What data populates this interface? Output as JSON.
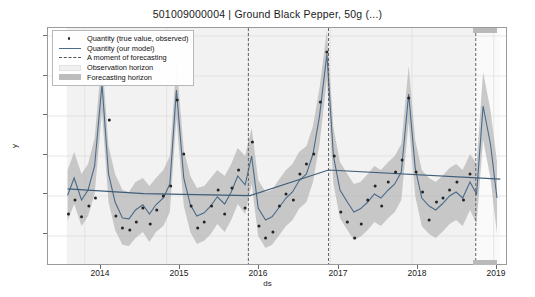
{
  "header": {
    "sku": "501009000004",
    "separator": "|",
    "product": "Ground Black Pepper, 50g (...)",
    "title": "501009000004   |   Ground Black Pepper, 50g (...)"
  },
  "legend": {
    "position": "upper-left",
    "items": [
      {
        "label": "Quantity (true value, observed)",
        "marker": "dot",
        "color": "#2b2b2b"
      },
      {
        "label": "Quantity (our model)",
        "marker": "line",
        "color": "#4a6b8a"
      },
      {
        "label": "A moment of forecasting",
        "marker": "dashed",
        "color": "#555555"
      },
      {
        "label": "Observation horizon",
        "marker": "patch",
        "color": "#f0f0f0"
      },
      {
        "label": "Forecasting horizon",
        "marker": "patch",
        "color": "#bcbcbc"
      }
    ]
  },
  "axes": {
    "ylabel": "y",
    "xlabel": "ds",
    "yticks": [
      "10000",
      "20000",
      "30000",
      "40000",
      "50000",
      "60000"
    ],
    "xticks": [
      "2014",
      "2015",
      "2016",
      "2017",
      "2018",
      "2019"
    ]
  },
  "chart_data": {
    "type": "line",
    "title": "501009000004   |   Ground Black Pepper, 50g (...)",
    "xlabel": "ds",
    "ylabel": "y",
    "ylim": [
      3000,
      62000
    ],
    "xlim": [
      2013.55,
      2019.15
    ],
    "grid": true,
    "legend_position": "upper-left",
    "ytick_values": [
      10000,
      20000,
      30000,
      40000,
      50000,
      60000
    ],
    "xtick_values": [
      2014,
      2015,
      2016,
      2017,
      2018,
      2019
    ],
    "forecast_cutoff_x": 2018.78,
    "changepoint_lines_x": [
      2016.0,
      2016.98
    ],
    "observation_horizon": [
      2013.78,
      2018.78
    ],
    "forecasting_horizon": [
      2018.78,
      2019.08
    ],
    "series": [
      {
        "name": "Quantity (our model)",
        "type": "line",
        "color": "#4a6b8a",
        "x": [
          2013.79,
          2013.87,
          2013.96,
          2014.04,
          2014.12,
          2014.21,
          2014.29,
          2014.37,
          2014.46,
          2014.54,
          2014.62,
          2014.71,
          2014.79,
          2014.87,
          2014.96,
          2015.04,
          2015.12,
          2015.21,
          2015.29,
          2015.37,
          2015.46,
          2015.54,
          2015.62,
          2015.71,
          2015.79,
          2015.87,
          2015.96,
          2016.04,
          2016.12,
          2016.21,
          2016.29,
          2016.37,
          2016.46,
          2016.54,
          2016.62,
          2016.71,
          2016.79,
          2016.87,
          2016.96,
          2017.04,
          2017.12,
          2017.21,
          2017.29,
          2017.37,
          2017.46,
          2017.54,
          2017.62,
          2017.71,
          2017.79,
          2017.87,
          2017.96,
          2018.04,
          2018.12,
          2018.21,
          2018.29,
          2018.37,
          2018.46,
          2018.54,
          2018.62,
          2018.71,
          2018.79,
          2018.87,
          2018.96,
          2019.04
        ],
        "y": [
          20200,
          24500,
          19000,
          21500,
          27500,
          48000,
          25500,
          18500,
          14500,
          14300,
          16500,
          17800,
          15500,
          17800,
          19500,
          23000,
          46500,
          24500,
          17800,
          15000,
          15800,
          17500,
          19800,
          18000,
          21000,
          25000,
          22800,
          30000,
          17000,
          14000,
          14800,
          17000,
          19500,
          21000,
          23800,
          25500,
          30500,
          40000,
          55500,
          30000,
          21500,
          18500,
          16000,
          16800,
          18500,
          20500,
          19500,
          21500,
          23000,
          26000,
          45500,
          27000,
          19500,
          17500,
          16500,
          18000,
          20000,
          21000,
          19500,
          23500,
          20500,
          42500,
          33000,
          19500
        ]
      },
      {
        "name": "Uncertainty band upper",
        "type": "band_upper",
        "color": "#b4b4b4",
        "y": [
          26500,
          31000,
          25500,
          28000,
          34500,
          55000,
          32500,
          25500,
          21500,
          21000,
          23500,
          24500,
          22500,
          24500,
          26500,
          30000,
          53500,
          31500,
          25000,
          22000,
          22500,
          24500,
          26500,
          25000,
          28000,
          32000,
          30000,
          37000,
          24000,
          21000,
          21500,
          24000,
          26500,
          28000,
          31000,
          32500,
          37500,
          47000,
          61500,
          37000,
          28500,
          25500,
          23000,
          23500,
          25500,
          27500,
          26500,
          28500,
          30000,
          33000,
          52500,
          34000,
          26500,
          24500,
          23500,
          25000,
          27000,
          28000,
          26500,
          30500,
          28000,
          51000,
          41500,
          28500
        ]
      },
      {
        "name": "Uncertainty band lower",
        "type": "band_lower",
        "color": "#b4b4b4",
        "y": [
          13800,
          18000,
          12500,
          15000,
          20500,
          41000,
          18500,
          11500,
          7800,
          7500,
          9500,
          11000,
          8500,
          11000,
          12500,
          16000,
          39500,
          17500,
          11000,
          8000,
          8800,
          10500,
          13000,
          11000,
          14000,
          18000,
          15500,
          23000,
          10000,
          7000,
          7800,
          10000,
          12500,
          14000,
          16800,
          18500,
          23500,
          33000,
          49000,
          23000,
          14500,
          11500,
          9000,
          9800,
          11500,
          13500,
          12500,
          14500,
          16000,
          19000,
          38500,
          20000,
          12500,
          10500,
          9500,
          11000,
          13000,
          14000,
          12500,
          16500,
          13000,
          34000,
          24500,
          10500
        ]
      },
      {
        "name": "Trend",
        "type": "trend",
        "color": "#3f5d78",
        "x": [
          2013.79,
          2014.72,
          2016.02,
          2016.98,
          2019.08
        ],
        "y": [
          21800,
          20600,
          20100,
          26500,
          24200
        ]
      },
      {
        "name": "Quantity (true value, observed)",
        "type": "scatter",
        "color": "#2b2b2b",
        "x": [
          2013.8,
          2013.88,
          2013.96,
          2014.05,
          2014.13,
          2014.21,
          2014.3,
          2014.38,
          2014.46,
          2014.55,
          2014.63,
          2014.71,
          2014.8,
          2014.88,
          2014.96,
          2015.05,
          2015.13,
          2015.21,
          2015.3,
          2015.38,
          2015.46,
          2015.55,
          2015.63,
          2015.71,
          2015.8,
          2015.88,
          2015.96,
          2016.05,
          2016.13,
          2016.21,
          2016.3,
          2016.38,
          2016.46,
          2016.55,
          2016.63,
          2016.71,
          2016.8,
          2016.88,
          2016.96,
          2017.05,
          2017.13,
          2017.21,
          2017.3,
          2017.38,
          2017.46,
          2017.55,
          2017.63,
          2017.71,
          2017.8,
          2017.88,
          2017.96,
          2018.05,
          2018.13,
          2018.21,
          2018.3,
          2018.38,
          2018.46,
          2018.55,
          2018.63,
          2018.71
        ],
        "y": [
          15500,
          19000,
          14800,
          17500,
          19500,
          52000,
          39000,
          15000,
          12000,
          11500,
          13500,
          17000,
          13000,
          16500,
          20000,
          22500,
          44000,
          30500,
          17500,
          12000,
          13500,
          17500,
          21500,
          15500,
          22000,
          26500,
          17000,
          33500,
          12500,
          9500,
          11000,
          17500,
          20500,
          19000,
          25500,
          28000,
          30500,
          43500,
          56000,
          30000,
          16000,
          13500,
          9500,
          13000,
          19000,
          22500,
          17500,
          23500,
          26000,
          29000,
          44500,
          26000,
          21000,
          14000,
          18500,
          19500,
          21500,
          23500,
          19000,
          25500
        ]
      },
      {
        "name": "Forecast extension",
        "type": "forecast_line",
        "color": "#4a6b8a",
        "x": [
          2018.79,
          2018.87,
          2018.96,
          2019.04
        ],
        "y": [
          20500,
          42500,
          33000,
          19500
        ]
      }
    ]
  }
}
